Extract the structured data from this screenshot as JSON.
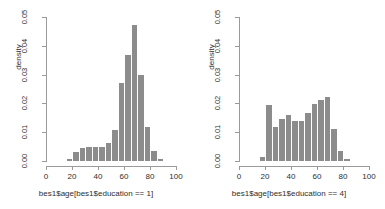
{
  "chart_data": [
    {
      "type": "bar",
      "panel": "left",
      "title": "",
      "xlabel": "bes1$age[bes1$education == 1]",
      "ylabel": "density",
      "xlim": [
        0,
        100
      ],
      "ylim": [
        0,
        0.05
      ],
      "xticks": [
        0,
        20,
        40,
        60,
        80,
        100
      ],
      "yticks": [
        "0.00",
        "0.01",
        "0.02",
        "0.03",
        "0.04",
        "0.05"
      ],
      "ytick_values": [
        0.0,
        0.01,
        0.02,
        0.03,
        0.04,
        0.05
      ],
      "bin_width": 5,
      "bin_starts": [
        15,
        20,
        25,
        30,
        35,
        40,
        45,
        50,
        55,
        60,
        65,
        70,
        75,
        80,
        85
      ],
      "values": [
        0.0008,
        0.0032,
        0.0044,
        0.0048,
        0.0048,
        0.005,
        0.0064,
        0.0108,
        0.027,
        0.0367,
        0.0474,
        0.0298,
        0.0117,
        0.0035,
        0.0006
      ],
      "bar_color": "#8c8c8c",
      "grid": false,
      "legend": "none"
    },
    {
      "type": "bar",
      "panel": "right",
      "title": "",
      "xlabel": "bes1$age[bes1$education == 4]",
      "ylabel": "density",
      "xlim": [
        0,
        100
      ],
      "ylim": [
        0,
        0.05
      ],
      "xticks": [
        0,
        20,
        40,
        60,
        80,
        100
      ],
      "yticks": [
        "0.00",
        "0.01",
        "0.02",
        "0.03",
        "0.04",
        "0.05"
      ],
      "ytick_values": [
        0.0,
        0.01,
        0.02,
        0.03,
        0.04,
        0.05
      ],
      "bin_width": 5,
      "bin_starts": [
        15,
        20,
        25,
        30,
        35,
        40,
        45,
        50,
        55,
        60,
        65,
        70,
        75,
        80
      ],
      "values": [
        0.0014,
        0.0194,
        0.0118,
        0.0145,
        0.0159,
        0.0138,
        0.0138,
        0.0168,
        0.0199,
        0.0213,
        0.0221,
        0.011,
        0.0035,
        0.0008
      ],
      "bar_color": "#8c8c8c",
      "grid": false,
      "legend": "none"
    }
  ],
  "panels": {
    "left": {
      "name": "histogram-education-1",
      "y_axis_title": "density",
      "x_axis_title": "bes1$age[bes1$education == 1]",
      "ytick_labels": [
        "0.00",
        "0.01",
        "0.02",
        "0.03",
        "0.04",
        "0.05"
      ],
      "xtick_labels": [
        "0",
        "20",
        "40",
        "60",
        "80",
        "100"
      ]
    },
    "right": {
      "name": "histogram-education-4",
      "y_axis_title": "density",
      "x_axis_title": "bes1$age[bes1$education == 4]",
      "ytick_labels": [
        "0.00",
        "0.01",
        "0.02",
        "0.03",
        "0.04",
        "0.05"
      ],
      "xtick_labels": [
        "0",
        "20",
        "40",
        "60",
        "80",
        "100"
      ]
    }
  },
  "style": {
    "background": "#ffffff",
    "bar_color": "#8c8c8c",
    "axis_color": "#9a9a9a",
    "text_color": "#2e2e2e"
  }
}
